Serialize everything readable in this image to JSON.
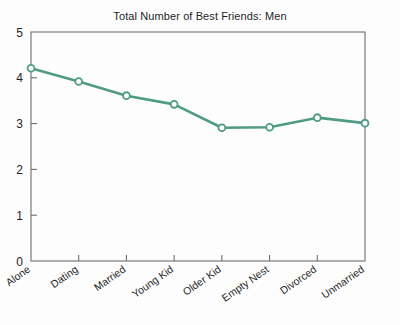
{
  "chart_data": {
    "type": "line",
    "title": "Total Number of Best Friends: Men",
    "xlabel": "",
    "ylabel": "",
    "categories": [
      "Alone",
      "Dating",
      "Married",
      "Young Kid",
      "Older Kid",
      "Empty Nest",
      "Divorced",
      "Unmarried"
    ],
    "values": [
      4.21,
      3.92,
      3.61,
      3.42,
      2.91,
      2.92,
      3.13,
      3.01
    ],
    "series": [
      {
        "name": "Men",
        "values": [
          4.21,
          3.92,
          3.61,
          3.42,
          2.91,
          2.92,
          3.13,
          3.01
        ]
      }
    ],
    "ylim": [
      0,
      5
    ],
    "ytick_labels": [
      "0",
      "1",
      "2",
      "3",
      "4",
      "5"
    ],
    "ytick_values": [
      0,
      1,
      2,
      3,
      4,
      5
    ],
    "grid": false,
    "legend": false,
    "legend_position": "none",
    "line_color": "#4f9b85",
    "marker": "open-circle",
    "marker_face_color": "#ffffff",
    "axis_color": "#6e6e6e",
    "background_color": "#fdfdfd"
  },
  "axes": {
    "y_ticks": [
      {
        "label": "5",
        "value": 5
      },
      {
        "label": "4",
        "value": 4
      },
      {
        "label": "3",
        "value": 3
      },
      {
        "label": "2",
        "value": 2
      },
      {
        "label": "1",
        "value": 1
      },
      {
        "label": "0",
        "value": 0
      }
    ],
    "x_ticks": [
      {
        "label": "Alone"
      },
      {
        "label": "Dating"
      },
      {
        "label": "Married"
      },
      {
        "label": "Young Kid"
      },
      {
        "label": "Older Kid"
      },
      {
        "label": "Empty Nest"
      },
      {
        "label": "Divorced"
      },
      {
        "label": "Unmarried"
      }
    ]
  }
}
